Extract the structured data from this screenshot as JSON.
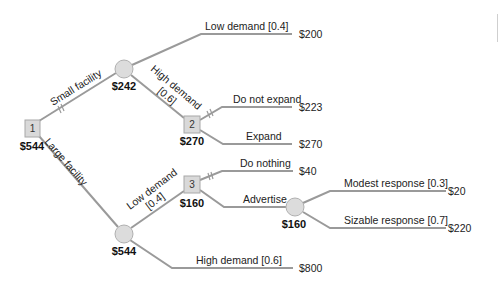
{
  "diagram": {
    "type": "decision-tree",
    "nodes": {
      "decision_1": {
        "label": "1",
        "value": "$544"
      },
      "chance_small": {
        "value": "$242"
      },
      "decision_2": {
        "label": "2",
        "value": "$270"
      },
      "chance_large": {
        "value": "$544"
      },
      "decision_3": {
        "label": "3",
        "value": "$160"
      },
      "chance_advertise": {
        "value": "$160"
      }
    },
    "branches": {
      "small_facility": "Small facility",
      "large_facility": "Large facility",
      "small_low_demand": "Low demand [0.4]",
      "small_high_demand_1": "High demand",
      "small_high_demand_2": "[0.6]",
      "do_not_expand": "Do not expand",
      "expand": "Expand",
      "large_low_demand_1": "Low demand",
      "large_low_demand_2": "[0.4]",
      "large_high_demand": "High demand [0.6]",
      "do_nothing": "Do nothing",
      "advertise": "Advertise",
      "modest_response": "Modest response [0.3]",
      "sizable_response": "Sizable response [0.7]"
    },
    "payoffs": {
      "small_low": "$200",
      "do_not_expand": "$223",
      "expand": "$270",
      "do_nothing": "$40",
      "modest": "$20",
      "sizable": "$220",
      "large_high": "$800"
    },
    "colors": {
      "line": "#9a9a9a",
      "node_fill": "#d9d9d9",
      "text": "#222222"
    }
  }
}
